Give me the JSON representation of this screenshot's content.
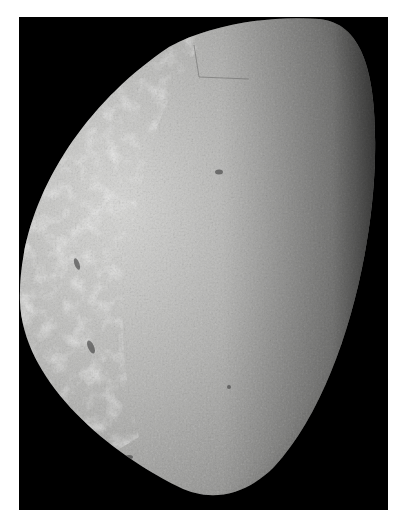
{
  "image": {
    "subject": "moon",
    "description": "Grayscale photograph of a large crescent/gibbous moon against black space, with bright mottled terrain on the left and finer textured gray terrain on the right",
    "colors": {
      "page_background": "#ffffff",
      "space_background": "#000000",
      "surface_light": "#d8d8d6",
      "surface_mid": "#a9a9a7",
      "surface_dark": "#6e6e6c",
      "limb_shadow": "#2a2a2a"
    }
  }
}
